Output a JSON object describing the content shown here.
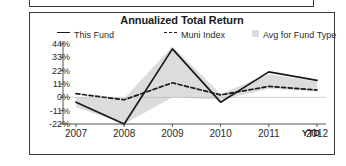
{
  "chart_data": {
    "type": "line",
    "title": "Annualized Total Return",
    "xlabel": "",
    "ylabel": "",
    "categories": [
      "2007",
      "2008",
      "2009",
      "2010",
      "2011",
      "2012"
    ],
    "x_axis_note": "YTD",
    "ytick_labels": [
      "44%",
      "33%",
      "22%",
      "11%",
      "0%",
      "-11%",
      "-22%"
    ],
    "ytick_values": [
      44,
      33,
      22,
      11,
      0,
      -11,
      -22
    ],
    "ylim": [
      -22,
      44
    ],
    "grid": false,
    "legend_position": "top",
    "series": [
      {
        "name": "This Fund",
        "style": "solid-line",
        "color": "#1a1a1a",
        "values": [
          -4,
          -22,
          40,
          -4,
          21,
          14
        ]
      },
      {
        "name": "Muni Index",
        "style": "dashed-line",
        "color": "#1a1a1a",
        "values": [
          3,
          -2,
          12,
          2,
          9,
          6
        ]
      },
      {
        "name": "Avg for Fund Type",
        "style": "shaded-band",
        "color": "#dcdcdc",
        "upper": [
          0,
          -1,
          42,
          3,
          19,
          13
        ],
        "lower": [
          -8,
          -22,
          0,
          -2,
          7,
          5
        ]
      }
    ]
  },
  "legend": {
    "fund_label": "This Fund",
    "index_label": "Muni Index",
    "avg_label": "Avg for Fund Type"
  },
  "icons": {
    "fund_swatch": "solid-line-icon",
    "index_swatch": "dashed-line-icon",
    "avg_swatch": "gray-square-icon"
  },
  "colors": {
    "line": "#1a1a1a",
    "band": "#dcdcdc",
    "axis": "#555555",
    "border": "#3a3a3a",
    "text": "#2a2a2a"
  }
}
